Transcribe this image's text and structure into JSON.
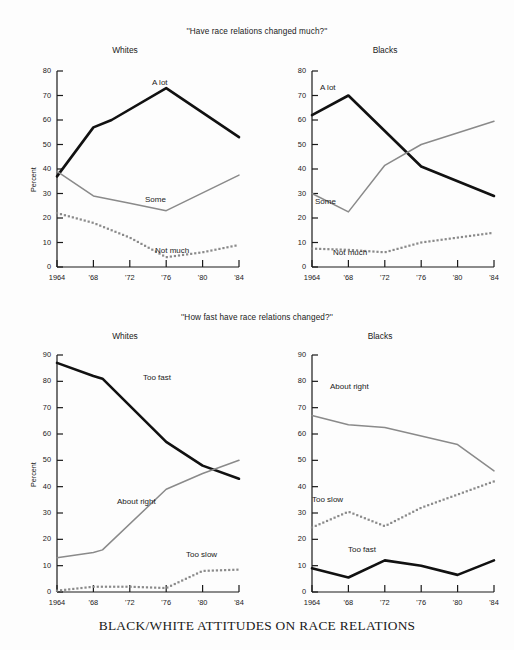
{
  "caption": "BLACK/WHITE ATTITUDES ON RACE RELATIONS",
  "ylabel": "Percent",
  "sections": [
    {
      "title": "''Have race relations changed much?''",
      "panels": [
        {
          "title": "Whites"
        },
        {
          "title": "Blacks"
        }
      ]
    },
    {
      "title": "''How fast have race relations changed?''",
      "panels": [
        {
          "title": "Whites"
        },
        {
          "title": "Blacks"
        }
      ]
    }
  ],
  "labels": {
    "a_lot": "A lot",
    "some": "Some",
    "not_much": "Not much",
    "too_fast": "Too fast",
    "about_right": "About right",
    "too_slow": "Too slow"
  },
  "colors": {
    "solid_black": "#111111",
    "gray_line": "#8a8a8a",
    "dotted_gray": "#8a8a8a",
    "axis": "#1a1a1a",
    "background": "#fdfdfd"
  },
  "chart_data": [
    {
      "id": "whites-changed-much",
      "type": "line",
      "title": "''Have race relations changed much?''",
      "subtitle": "Whites",
      "xlabel": "",
      "ylabel": "Percent",
      "xlim": [
        1964,
        1984
      ],
      "ylim": [
        0,
        80
      ],
      "ytick_labels": [
        "0",
        "10",
        "20",
        "30",
        "40",
        "50",
        "60",
        "70",
        "80"
      ],
      "yticks": [
        0,
        10,
        20,
        30,
        40,
        50,
        60,
        70,
        80
      ],
      "xticks": [
        1964,
        1968,
        1972,
        1976,
        1980,
        1984
      ],
      "xtick_labels": [
        "1964",
        "'68",
        "'72",
        "'76",
        "'80",
        "'84"
      ],
      "grid": false,
      "legend": "inline-annotations",
      "series": [
        {
          "name": "A lot",
          "style": "solid-black",
          "x": [
            1964,
            1968,
            1970,
            1976,
            1984
          ],
          "values": [
            37,
            57,
            60,
            73,
            53
          ]
        },
        {
          "name": "Some",
          "style": "solid-gray",
          "x": [
            1964,
            1968,
            1972,
            1976,
            1984
          ],
          "values": [
            39,
            29,
            26,
            23,
            37.5
          ]
        },
        {
          "name": "Not much",
          "style": "dotted-gray",
          "x": [
            1964,
            1968,
            1972,
            1976,
            1980,
            1984
          ],
          "values": [
            22,
            18,
            12,
            4,
            6,
            9
          ]
        }
      ]
    },
    {
      "id": "blacks-changed-much",
      "type": "line",
      "title": "''Have race relations changed much?''",
      "subtitle": "Blacks",
      "xlabel": "",
      "ylabel": "",
      "xlim": [
        1964,
        1984
      ],
      "ylim": [
        0,
        80
      ],
      "ytick_labels": [
        "0",
        "10",
        "20",
        "30",
        "40",
        "50",
        "60",
        "70",
        "80"
      ],
      "yticks": [
        0,
        10,
        20,
        30,
        40,
        50,
        60,
        70,
        80
      ],
      "xticks": [
        1964,
        1968,
        1972,
        1976,
        1980,
        1984
      ],
      "xtick_labels": [
        "1964",
        "'68",
        "'72",
        "'76",
        "'80",
        "'84"
      ],
      "grid": false,
      "legend": "inline-annotations",
      "series": [
        {
          "name": "A lot",
          "style": "solid-black",
          "x": [
            1964,
            1968,
            1976,
            1984
          ],
          "values": [
            62,
            70,
            41,
            29
          ]
        },
        {
          "name": "Some",
          "style": "solid-gray",
          "x": [
            1964,
            1968,
            1972,
            1976,
            1984
          ],
          "values": [
            30,
            22.5,
            41.5,
            50,
            59.5
          ]
        },
        {
          "name": "Not much",
          "style": "dotted-gray",
          "x": [
            1964,
            1968,
            1972,
            1976,
            1984
          ],
          "values": [
            7.5,
            7,
            6,
            10,
            14
          ]
        }
      ]
    },
    {
      "id": "whites-how-fast",
      "type": "line",
      "title": "''How fast have race relations changed?''",
      "subtitle": "Whites",
      "xlabel": "",
      "ylabel": "Percent",
      "xlim": [
        1964,
        1984
      ],
      "ylim": [
        0,
        90
      ],
      "ytick_labels": [
        "0",
        "10",
        "20",
        "30",
        "40",
        "50",
        "60",
        "70",
        "80",
        "90"
      ],
      "yticks": [
        0,
        10,
        20,
        30,
        40,
        50,
        60,
        70,
        80,
        90
      ],
      "xticks": [
        1964,
        1968,
        1972,
        1976,
        1980,
        1984
      ],
      "xtick_labels": [
        "1964",
        "'68",
        "'72",
        "'76",
        "'80",
        "'84"
      ],
      "grid": false,
      "legend": "inline-annotations",
      "series": [
        {
          "name": "Too fast",
          "style": "solid-black",
          "x": [
            1964,
            1968,
            1969,
            1976,
            1980,
            1984
          ],
          "values": [
            87,
            82,
            81,
            57,
            48,
            43
          ]
        },
        {
          "name": "About right",
          "style": "solid-gray",
          "x": [
            1964,
            1968,
            1969,
            1976,
            1980,
            1984
          ],
          "values": [
            13,
            15,
            16,
            39,
            45,
            50
          ]
        },
        {
          "name": "Too slow",
          "style": "dotted-gray",
          "x": [
            1964,
            1968,
            1972,
            1976,
            1980,
            1984
          ],
          "values": [
            0.5,
            2,
            2,
            1.5,
            8,
            8.5
          ]
        }
      ]
    },
    {
      "id": "blacks-how-fast",
      "type": "line",
      "title": "''How fast have race relations changed?''",
      "subtitle": "Blacks",
      "xlabel": "",
      "ylabel": "",
      "xlim": [
        1964,
        1984
      ],
      "ylim": [
        0,
        90
      ],
      "ytick_labels": [
        "0",
        "10",
        "20",
        "30",
        "40",
        "50",
        "60",
        "70",
        "80",
        "90"
      ],
      "yticks": [
        0,
        10,
        20,
        30,
        40,
        50,
        60,
        70,
        80,
        90
      ],
      "xticks": [
        1964,
        1968,
        1972,
        1976,
        1980,
        1984
      ],
      "xtick_labels": [
        "1964",
        "'68",
        "'72",
        "'76",
        "'80",
        "'84"
      ],
      "grid": false,
      "legend": "inline-annotations",
      "series": [
        {
          "name": "About right",
          "style": "solid-gray",
          "x": [
            1964,
            1968,
            1972,
            1980,
            1984
          ],
          "values": [
            67,
            63.5,
            62.5,
            56,
            46
          ]
        },
        {
          "name": "Too slow",
          "style": "dotted-gray",
          "x": [
            1964,
            1968,
            1972,
            1976,
            1980,
            1984
          ],
          "values": [
            24.5,
            30.5,
            25,
            32,
            37,
            42
          ]
        },
        {
          "name": "Too fast",
          "style": "solid-black",
          "x": [
            1964,
            1968,
            1972,
            1976,
            1980,
            1984
          ],
          "values": [
            9,
            5.5,
            12,
            10,
            6.5,
            12
          ]
        }
      ]
    }
  ],
  "annotations": [
    {
      "panel": 0,
      "text": "A lot",
      "x": 152,
      "y": 78
    },
    {
      "panel": 0,
      "text": "Some",
      "x": 145,
      "y": 195
    },
    {
      "panel": 0,
      "text": "Not much",
      "x": 155,
      "y": 246
    },
    {
      "panel": 1,
      "text": "A lot",
      "x": 320,
      "y": 83
    },
    {
      "panel": 1,
      "text": "Some",
      "x": 315,
      "y": 197
    },
    {
      "panel": 1,
      "text": "Not much",
      "x": 333,
      "y": 248
    },
    {
      "panel": 2,
      "text": "Too fast",
      "x": 143,
      "y": 373
    },
    {
      "panel": 2,
      "text": "About right",
      "x": 117,
      "y": 497
    },
    {
      "panel": 2,
      "text": "Too slow",
      "x": 186,
      "y": 550
    },
    {
      "panel": 3,
      "text": "About right",
      "x": 330,
      "y": 382
    },
    {
      "panel": 3,
      "text": "Too slow",
      "x": 312,
      "y": 495
    },
    {
      "panel": 3,
      "text": "Too fast",
      "x": 348,
      "y": 545
    }
  ]
}
